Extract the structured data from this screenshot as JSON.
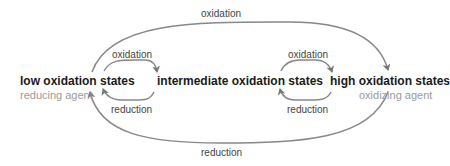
{
  "diagram": {
    "nodes": [
      {
        "id": "low",
        "label": "low oxidation states",
        "sublabel": "reducing agent"
      },
      {
        "id": "mid",
        "label": "intermediate oxidation states"
      },
      {
        "id": "high",
        "label": "high oxidation states",
        "sublabel": "oxidizing agent"
      }
    ],
    "edges": [
      {
        "from": "low",
        "to": "mid",
        "label": "oxidation"
      },
      {
        "from": "mid",
        "to": "low",
        "label": "reduction"
      },
      {
        "from": "mid",
        "to": "high",
        "label": "oxidation"
      },
      {
        "from": "high",
        "to": "mid",
        "label": "reduction"
      },
      {
        "from": "low",
        "to": "high",
        "label": "oxidation"
      },
      {
        "from": "high",
        "to": "low",
        "label": "reduction"
      }
    ]
  },
  "colors": {
    "arrow": "#777777",
    "state_text": "#1a1a1a",
    "agent_text": "#9a9a9a"
  }
}
